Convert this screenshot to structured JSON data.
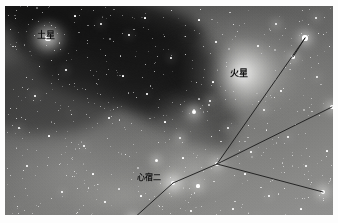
{
  "image": {
    "kind": "astrophotograph",
    "subject": "rho-ophiuchi-antares-region",
    "width": 338,
    "height": 223,
    "frame": {
      "left": 5,
      "top": 6,
      "width": 328,
      "height": 209,
      "matte_color": "#fdfdfd"
    },
    "palette": {
      "sky_dark": "#4a4a49",
      "sky_mid": "#7c7c7a",
      "sky_light": "#919190",
      "dark_nebula": "#141414",
      "star_white": "#ffffff",
      "label_text": "#101010",
      "line_color": "#1a1a1a"
    }
  },
  "labels": [
    {
      "id": "saturn",
      "text": "土星",
      "x": 32,
      "y": 25,
      "font_size": 9
    },
    {
      "id": "mars",
      "text": "火星",
      "x": 225,
      "y": 63,
      "font_size": 9
    },
    {
      "id": "antares",
      "text": "心宿二",
      "x": 132,
      "y": 168,
      "font_size": 8
    }
  ],
  "objects": [
    {
      "id": "saturn",
      "name": "土星",
      "x": 43,
      "y": 32,
      "glow_radius": 17,
      "core": 2.6,
      "brightness": "bright"
    },
    {
      "id": "mars",
      "name": "火星",
      "x": 237,
      "y": 68,
      "glow_radius": 34,
      "core": 3.4,
      "brightness": "brightest"
    },
    {
      "id": "antares",
      "name": "心宿二",
      "x": 168,
      "y": 177,
      "glow_radius": 13,
      "core": 2.4,
      "brightness": "bright"
    }
  ],
  "constellation": {
    "name": "scorpius-head-lines",
    "vertex": {
      "x": 212,
      "y": 158
    },
    "segments": [
      {
        "from": [
          212,
          158
        ],
        "to": [
          300,
          32
        ],
        "name": "line-to-upper-right"
      },
      {
        "from": [
          212,
          158
        ],
        "to": [
          327,
          101
        ],
        "name": "line-to-right"
      },
      {
        "from": [
          212,
          158
        ],
        "to": [
          318,
          186
        ],
        "name": "line-to-lower-right"
      },
      {
        "from": [
          212,
          158
        ],
        "to": [
          168,
          177
        ],
        "name": "line-to-antares"
      },
      {
        "from": [
          168,
          177
        ],
        "to": [
          128,
          213
        ],
        "name": "line-antares-to-lower-left"
      },
      {
        "from": [
          300,
          32
        ],
        "to": [
          288,
          51
        ],
        "name": "line-upper-right-short"
      }
    ]
  },
  "stars": [
    {
      "x": 43,
      "y": 32,
      "r": 2.6,
      "h": 17
    },
    {
      "x": 237,
      "y": 68,
      "r": 3.4,
      "h": 34
    },
    {
      "x": 168,
      "y": 177,
      "r": 2.4,
      "h": 13
    },
    {
      "x": 212,
      "y": 158,
      "r": 2.2,
      "h": 8
    },
    {
      "x": 300,
      "y": 32,
      "r": 2.6,
      "h": 11
    },
    {
      "x": 288,
      "y": 51,
      "r": 1.8,
      "h": 7
    },
    {
      "x": 327,
      "y": 101,
      "r": 2.2,
      "h": 9
    },
    {
      "x": 318,
      "y": 186,
      "r": 2.4,
      "h": 10
    },
    {
      "x": 128,
      "y": 213,
      "r": 2.2,
      "h": 9
    },
    {
      "x": 189,
      "y": 106,
      "r": 2.0,
      "h": 10
    },
    {
      "x": 193,
      "y": 180,
      "r": 1.6,
      "h": 7
    },
    {
      "x": 175,
      "y": 132,
      "r": 1.4,
      "h": 6
    },
    {
      "x": 151,
      "y": 154,
      "r": 1.5,
      "h": 7
    },
    {
      "x": 205,
      "y": 95,
      "r": 1.2,
      "h": 5
    },
    {
      "x": 223,
      "y": 122,
      "r": 1.1,
      "h": 4
    },
    {
      "x": 271,
      "y": 18,
      "r": 1.3,
      "h": 5
    },
    {
      "x": 311,
      "y": 12,
      "r": 1.1,
      "h": 4
    },
    {
      "x": 259,
      "y": 104,
      "r": 1.0,
      "h": 4
    },
    {
      "x": 96,
      "y": 18,
      "r": 0.9,
      "h": 3
    },
    {
      "x": 124,
      "y": 29,
      "r": 0.8,
      "h": 3
    },
    {
      "x": 166,
      "y": 52,
      "r": 0.9,
      "h": 3
    },
    {
      "x": 211,
      "y": 36,
      "r": 0.7,
      "h": 2
    },
    {
      "x": 61,
      "y": 64,
      "r": 0.8,
      "h": 3
    },
    {
      "x": 30,
      "y": 90,
      "r": 0.8,
      "h": 3
    },
    {
      "x": 14,
      "y": 122,
      "r": 0.9,
      "h": 3
    },
    {
      "x": 79,
      "y": 140,
      "r": 0.8,
      "h": 3
    },
    {
      "x": 104,
      "y": 112,
      "r": 0.7,
      "h": 2
    },
    {
      "x": 142,
      "y": 88,
      "r": 0.7,
      "h": 2
    },
    {
      "x": 246,
      "y": 146,
      "r": 0.8,
      "h": 3
    },
    {
      "x": 283,
      "y": 131,
      "r": 0.8,
      "h": 3
    },
    {
      "x": 301,
      "y": 160,
      "r": 0.7,
      "h": 2
    },
    {
      "x": 264,
      "y": 190,
      "r": 0.8,
      "h": 3
    },
    {
      "x": 228,
      "y": 203,
      "r": 0.7,
      "h": 2
    },
    {
      "x": 186,
      "y": 205,
      "r": 0.7,
      "h": 2
    },
    {
      "x": 57,
      "y": 186,
      "r": 0.8,
      "h": 3
    },
    {
      "x": 100,
      "y": 196,
      "r": 0.7,
      "h": 2
    },
    {
      "x": 22,
      "y": 160,
      "r": 0.7,
      "h": 2
    },
    {
      "x": 312,
      "y": 71,
      "r": 0.9,
      "h": 3
    },
    {
      "x": 253,
      "y": 40,
      "r": 0.7,
      "h": 2
    },
    {
      "x": 194,
      "y": 14,
      "r": 0.6,
      "h": 2
    },
    {
      "x": 140,
      "y": 12,
      "r": 0.6,
      "h": 2
    },
    {
      "x": 70,
      "y": 10,
      "r": 0.6,
      "h": 2
    },
    {
      "x": 118,
      "y": 70,
      "r": 0.6,
      "h": 2
    },
    {
      "x": 160,
      "y": 116,
      "r": 0.6,
      "h": 2
    },
    {
      "x": 208,
      "y": 76,
      "r": 0.6,
      "h": 2
    },
    {
      "x": 276,
      "y": 85,
      "r": 0.7,
      "h": 2
    },
    {
      "x": 44,
      "y": 130,
      "r": 0.6,
      "h": 2
    },
    {
      "x": 88,
      "y": 168,
      "r": 0.6,
      "h": 2
    },
    {
      "x": 136,
      "y": 190,
      "r": 0.6,
      "h": 2
    },
    {
      "x": 296,
      "y": 203,
      "r": 0.6,
      "h": 2
    },
    {
      "x": 322,
      "y": 145,
      "r": 0.6,
      "h": 2
    },
    {
      "x": 240,
      "y": 168,
      "r": 0.6,
      "h": 2
    },
    {
      "x": 178,
      "y": 152,
      "r": 0.6,
      "h": 2
    },
    {
      "x": 120,
      "y": 148,
      "r": 0.5,
      "h": 2
    },
    {
      "x": 66,
      "y": 108,
      "r": 0.5,
      "h": 2
    },
    {
      "x": 34,
      "y": 60,
      "r": 0.5,
      "h": 2
    },
    {
      "x": 180,
      "y": 30,
      "r": 0.5,
      "h": 2
    },
    {
      "x": 228,
      "y": 18,
      "r": 0.5,
      "h": 2
    },
    {
      "x": 290,
      "y": 118,
      "r": 0.5,
      "h": 2
    },
    {
      "x": 206,
      "y": 130,
      "r": 0.5,
      "h": 2
    },
    {
      "x": 154,
      "y": 200,
      "r": 0.5,
      "h": 2
    },
    {
      "x": 72,
      "y": 206,
      "r": 0.5,
      "h": 2
    },
    {
      "x": 12,
      "y": 200,
      "r": 0.5,
      "h": 2
    },
    {
      "x": 10,
      "y": 40,
      "r": 0.5,
      "h": 2
    },
    {
      "x": 252,
      "y": 210,
      "r": 0.5,
      "h": 2
    },
    {
      "x": 324,
      "y": 40,
      "r": 0.5,
      "h": 2
    }
  ],
  "nebulosity": [
    {
      "x": 237,
      "y": 68,
      "w": 120,
      "h": 86,
      "alpha": 0.42,
      "name": "mars-glow-region"
    },
    {
      "x": 186,
      "y": 112,
      "w": 80,
      "h": 62,
      "alpha": 0.3,
      "name": "rho-ophiuchi-glow"
    },
    {
      "x": 168,
      "y": 177,
      "w": 70,
      "h": 44,
      "alpha": 0.34,
      "name": "antares-nebula"
    },
    {
      "x": 43,
      "y": 32,
      "w": 46,
      "h": 36,
      "alpha": 0.4,
      "name": "saturn-glow"
    },
    {
      "x": 120,
      "y": 190,
      "w": 130,
      "h": 60,
      "alpha": 0.2,
      "name": "lower-left-haze"
    }
  ]
}
